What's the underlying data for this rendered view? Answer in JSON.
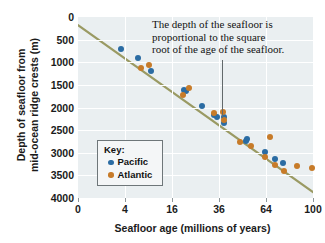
{
  "chart_data": {
    "type": "scatter",
    "title": "",
    "xlabel": "Seafloor age (millions of years)",
    "ylabel": "Depth of seafloor from mid-ocean ridge crests (m)",
    "ylabel_line1": "Depth of seafloor from",
    "ylabel_line2": "mid-ocean ridge crests (m)",
    "x_scale": "sqrt",
    "x_ticks": [
      0,
      4,
      16,
      36,
      64,
      100
    ],
    "x_tick_labels": [
      "0",
      "4",
      "16",
      "36",
      "64",
      "100"
    ],
    "xlim": [
      0,
      100
    ],
    "y_ticks": [
      0,
      500,
      1000,
      1500,
      2000,
      2500,
      3000,
      3500,
      4000
    ],
    "y_tick_labels": [
      "0",
      "500",
      "1000",
      "1500",
      "2000",
      "2500",
      "3000",
      "3500",
      "4000"
    ],
    "ylim": [
      0,
      4000
    ],
    "y_inverted": true,
    "grid": true,
    "legend_position": "center-left",
    "legend_title": "Key:",
    "annotation": "The depth of the seafloor is proportional to the square root of the age of the seafloor.",
    "annotation_lines": [
      "The depth of the seafloor is",
      "proportional to the square",
      "root of the age of the seafloor."
    ],
    "trend_line": {
      "label": "square-root fit",
      "color": "#9a9a63",
      "x_start": 0,
      "y_start": 180,
      "x_end": 100,
      "y_end": 3870
    },
    "series": [
      {
        "name": "Pacific",
        "color": "#2b6ca3",
        "points": [
          {
            "x": 3.4,
            "y": 700
          },
          {
            "x": 6.6,
            "y": 910
          },
          {
            "x": 9.6,
            "y": 1200
          },
          {
            "x": 20.5,
            "y": 1620
          },
          {
            "x": 21.0,
            "y": 1640
          },
          {
            "x": 28.0,
            "y": 1960
          },
          {
            "x": 33.5,
            "y": 2170
          },
          {
            "x": 35.0,
            "y": 2200
          },
          {
            "x": 38.5,
            "y": 2220
          },
          {
            "x": 38.5,
            "y": 2350
          },
          {
            "x": 51.0,
            "y": 2730
          },
          {
            "x": 52.0,
            "y": 2700
          },
          {
            "x": 63.0,
            "y": 2990
          },
          {
            "x": 70.0,
            "y": 3140
          },
          {
            "x": 76.0,
            "y": 3220
          }
        ]
      },
      {
        "name": "Atlantic",
        "color": "#c77b29",
        "points": [
          {
            "x": 7.2,
            "y": 1130
          },
          {
            "x": 9.2,
            "y": 1050
          },
          {
            "x": 20.0,
            "y": 1730
          },
          {
            "x": 22.5,
            "y": 1560
          },
          {
            "x": 33.5,
            "y": 2130
          },
          {
            "x": 38.0,
            "y": 2090
          },
          {
            "x": 38.5,
            "y": 2270
          },
          {
            "x": 47.5,
            "y": 2770
          },
          {
            "x": 54.0,
            "y": 2840
          },
          {
            "x": 63.5,
            "y": 3100
          },
          {
            "x": 67.0,
            "y": 2650
          },
          {
            "x": 70.5,
            "y": 3260
          },
          {
            "x": 76.5,
            "y": 3400
          },
          {
            "x": 87.0,
            "y": 3300
          },
          {
            "x": 99.0,
            "y": 3340
          }
        ]
      }
    ]
  }
}
